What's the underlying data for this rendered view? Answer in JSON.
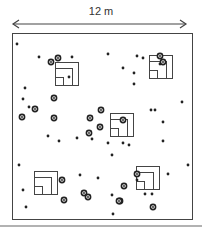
{
  "diagram": {
    "scale_label": "12 m",
    "colors": {
      "stroke": "#444444",
      "dot": "#222222",
      "rule": "#999999"
    },
    "plot": {
      "x": 12,
      "y": 33,
      "w": 180,
      "h": 186
    },
    "arrow": {
      "y": 24,
      "x1": 13,
      "x2": 186
    },
    "bottom_rule_y": 226,
    "quadrats": [
      {
        "id": "q1",
        "x": 55,
        "y": 62,
        "size": 23
      },
      {
        "id": "q2",
        "x": 149,
        "y": 55,
        "size": 23
      },
      {
        "id": "q3",
        "x": 110,
        "y": 113,
        "size": 23
      },
      {
        "id": "q4",
        "x": 34,
        "y": 171,
        "size": 23
      },
      {
        "id": "q5",
        "x": 136,
        "y": 166,
        "size": 23
      }
    ],
    "small_points": [
      [
        17,
        44
      ],
      [
        39,
        57
      ],
      [
        72,
        57
      ],
      [
        108,
        54
      ],
      [
        137,
        56
      ],
      [
        143,
        58
      ],
      [
        25,
        88
      ],
      [
        23,
        99
      ],
      [
        29,
        107
      ],
      [
        69,
        77
      ],
      [
        123,
        68
      ],
      [
        134,
        73
      ],
      [
        134,
        84
      ],
      [
        160,
        64
      ],
      [
        182,
        102
      ],
      [
        151,
        110
      ],
      [
        155,
        110
      ],
      [
        163,
        122
      ],
      [
        163,
        141
      ],
      [
        92,
        139
      ],
      [
        129,
        145
      ],
      [
        48,
        136
      ],
      [
        108,
        143
      ],
      [
        77,
        138
      ],
      [
        59,
        141
      ],
      [
        19,
        165
      ],
      [
        23,
        190
      ],
      [
        26,
        207
      ],
      [
        123,
        143
      ],
      [
        112,
        155
      ],
      [
        112,
        195
      ],
      [
        168,
        174
      ],
      [
        188,
        165
      ],
      [
        145,
        194
      ],
      [
        152,
        194
      ],
      [
        113,
        214
      ],
      [
        98,
        178
      ],
      [
        80,
        175
      ],
      [
        137,
        180
      ]
    ],
    "ring_points": [
      [
        51,
        62
      ],
      [
        58,
        58
      ],
      [
        54,
        98
      ],
      [
        54,
        118
      ],
      [
        100,
        127
      ],
      [
        89,
        133
      ],
      [
        90,
        118
      ],
      [
        35,
        109
      ],
      [
        22,
        117
      ],
      [
        160,
        56
      ],
      [
        163,
        62
      ],
      [
        123,
        120
      ],
      [
        62,
        180
      ],
      [
        84,
        193
      ],
      [
        88,
        197
      ],
      [
        64,
        200
      ],
      [
        120,
        201
      ],
      [
        153,
        207
      ],
      [
        137,
        174
      ],
      [
        119,
        201
      ],
      [
        101,
        110
      ],
      [
        124,
        186
      ]
    ]
  }
}
